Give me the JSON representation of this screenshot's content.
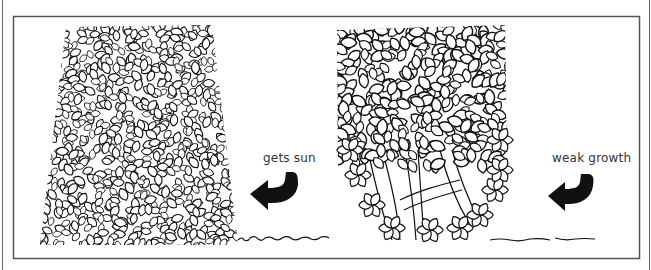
{
  "figure": {
    "colors": {
      "ink": "#111111",
      "frame": "#555555",
      "background": "#ffffff"
    }
  },
  "hedges": [
    {
      "id": "left",
      "shape": "tapered-wide-base",
      "label": "gets sun",
      "arrow_icon": "curved-arrow-left-icon"
    },
    {
      "id": "right",
      "shape": "wide-top-bare-base",
      "label": "weak growth",
      "arrow_icon": "curved-arrow-left-icon"
    }
  ]
}
